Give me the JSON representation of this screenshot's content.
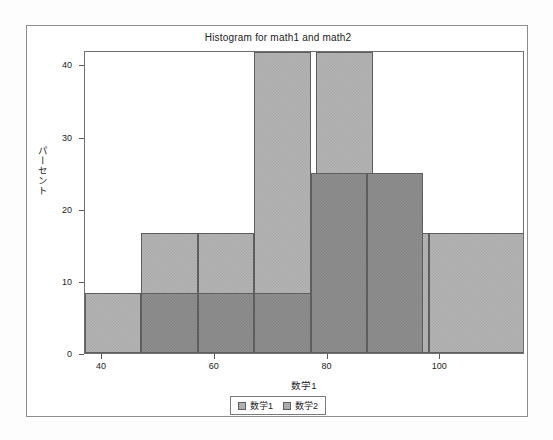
{
  "chart_data": {
    "type": "bar",
    "subtype": "overlaid-histogram",
    "title": "Histogram for math1 and math2",
    "xlabel": "数学1",
    "ylabel": "パーセント",
    "xlim": [
      37,
      115
    ],
    "ylim": [
      0,
      42
    ],
    "xticks": [
      40,
      60,
      80,
      100
    ],
    "xticklabels": [
      "40",
      "60",
      "80",
      "100"
    ],
    "yticks": [
      0,
      10,
      20,
      30,
      40
    ],
    "yticklabels": [
      "0",
      "10",
      "20",
      "30",
      "40"
    ],
    "grid": false,
    "legend_position": "bottom-center",
    "legend": [
      {
        "label": "数学1",
        "color": "#b4b4b4"
      },
      {
        "label": "数学2",
        "color": "#8e8e8e"
      }
    ],
    "series": [
      {
        "name": "数学1",
        "color": "#b4b4b4",
        "bins": [
          {
            "x0": 37.0,
            "x1": 47.0,
            "value": 8.3
          },
          {
            "x0": 47.0,
            "x1": 57.0,
            "value": 16.7
          },
          {
            "x0": 57.0,
            "x1": 67.0,
            "value": 16.7
          },
          {
            "x0": 67.0,
            "x1": 77.0,
            "value": 41.7
          },
          {
            "x0": 78.0,
            "x1": 88.0,
            "value": 41.7
          },
          {
            "x0": 88.0,
            "x1": 98.0,
            "value": 16.7
          },
          {
            "x0": 98.0,
            "x1": 115.0,
            "value": 16.7
          }
        ]
      },
      {
        "name": "数学2",
        "color": "#8e8e8e",
        "bins": [
          {
            "x0": 47.0,
            "x1": 57.0,
            "value": 8.3
          },
          {
            "x0": 57.0,
            "x1": 67.0,
            "value": 8.3
          },
          {
            "x0": 67.0,
            "x1": 77.0,
            "value": 8.3
          },
          {
            "x0": 77.0,
            "x1": 87.0,
            "value": 25.0
          },
          {
            "x0": 87.0,
            "x1": 97.0,
            "value": 25.0
          }
        ]
      }
    ]
  }
}
